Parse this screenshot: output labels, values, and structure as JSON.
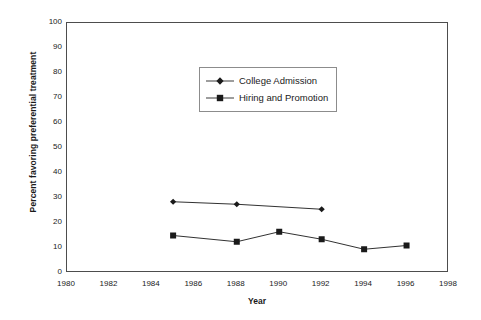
{
  "chart_data": {
    "type": "line",
    "title": "",
    "xlabel": "Year",
    "ylabel": "Percent favoring preferential treatment",
    "xlim": [
      1980,
      1998
    ],
    "ylim": [
      0,
      100
    ],
    "xticks": [
      1980,
      1982,
      1984,
      1986,
      1988,
      1990,
      1992,
      1994,
      1996,
      1998
    ],
    "yticks": [
      0,
      10,
      20,
      30,
      40,
      50,
      60,
      70,
      80,
      90,
      100
    ],
    "grid": false,
    "legend_position": "upper center",
    "series": [
      {
        "name": "College Admission",
        "marker": "diamond",
        "color": "#1a1a1a",
        "x": [
          1985,
          1988,
          1992
        ],
        "values": [
          28.5,
          27.5,
          25.5
        ]
      },
      {
        "name": "Hiring and Promotion",
        "marker": "square",
        "color": "#1a1a1a",
        "x": [
          1985,
          1988,
          1990,
          1992,
          1994,
          1996
        ],
        "values": [
          15,
          12.5,
          16.5,
          13.5,
          9.5,
          11
        ]
      }
    ]
  },
  "axis": {
    "x_title": "Year",
    "y_title": "Percent favoring preferential treatment"
  },
  "legend": {
    "items": [
      {
        "label": "College Admission"
      },
      {
        "label": "Hiring and Promotion"
      }
    ]
  }
}
